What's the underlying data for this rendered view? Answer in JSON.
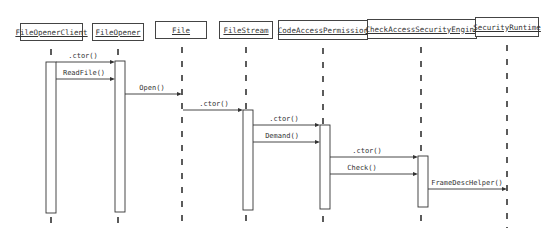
{
  "diagram": {
    "type": "sequence",
    "participants": [
      {
        "name": "FileOpenerClient",
        "x": 51,
        "box": [
          20,
          23,
          63,
          18
        ]
      },
      {
        "name": "FileOpener",
        "x": 118,
        "box": [
          92,
          23,
          52,
          18
        ]
      },
      {
        "name": "File",
        "x": 182,
        "box": [
          155,
          21,
          52,
          18
        ]
      },
      {
        "name": "FileStream",
        "x": 246,
        "box": [
          219,
          21,
          54,
          18
        ]
      },
      {
        "name": "CodeAccessPermission",
        "x": 323,
        "box": [
          278,
          20,
          90,
          20
        ]
      },
      {
        "name": "CheckAccessSecurityEngine",
        "x": 421,
        "box": [
          367,
          19,
          110,
          20
        ]
      },
      {
        "name": "SecurityRuntime",
        "x": 507,
        "box": [
          475,
          17,
          64,
          20
        ]
      }
    ],
    "activations": [
      {
        "participant": "FileOpenerClient",
        "x": 46,
        "y1": 62,
        "y2": 213,
        "w": 10
      },
      {
        "participant": "FileOpener",
        "x": 115,
        "y1": 61,
        "y2": 212,
        "w": 10
      },
      {
        "participant": "FileStream",
        "x": 243,
        "y1": 110,
        "y2": 210,
        "w": 10
      },
      {
        "participant": "CodeAccessPermission",
        "x": 320,
        "y1": 125,
        "y2": 209,
        "w": 10
      },
      {
        "participant": "CheckAccessSecurityEngine",
        "x": 418,
        "y1": 156,
        "y2": 207,
        "w": 10
      }
    ],
    "messages": [
      {
        "label": ".ctor()",
        "from_x": 56,
        "to_x": 115,
        "y": 62,
        "label_x": 83,
        "label_y": 52
      },
      {
        "label": "ReadFile()",
        "from_x": 56,
        "to_x": 115,
        "y": 79,
        "label_x": 84,
        "label_y": 69
      },
      {
        "label": "Open()",
        "from_x": 125,
        "to_x": 182,
        "y": 94,
        "label_x": 152,
        "label_y": 84
      },
      {
        "label": ".ctor()",
        "from_x": 183,
        "to_x": 243,
        "y": 110,
        "label_x": 214,
        "label_y": 100
      },
      {
        "label": ".ctor()",
        "from_x": 253,
        "to_x": 320,
        "y": 125,
        "label_x": 284,
        "label_y": 115
      },
      {
        "label": "Demand()",
        "from_x": 253,
        "to_x": 320,
        "y": 142,
        "label_x": 282,
        "label_y": 132
      },
      {
        "label": ".ctor()",
        "from_x": 330,
        "to_x": 418,
        "y": 157,
        "label_x": 367,
        "label_y": 147
      },
      {
        "label": "Check()",
        "from_x": 330,
        "to_x": 418,
        "y": 174,
        "label_x": 362,
        "label_y": 164
      },
      {
        "label": "FrameDescHelper()",
        "from_x": 428,
        "to_x": 507,
        "y": 189,
        "label_x": 467,
        "label_y": 179
      }
    ],
    "colors": {
      "line": "#333333",
      "box_border": "#444444",
      "background": "#ffffff",
      "text": "#333333"
    }
  }
}
